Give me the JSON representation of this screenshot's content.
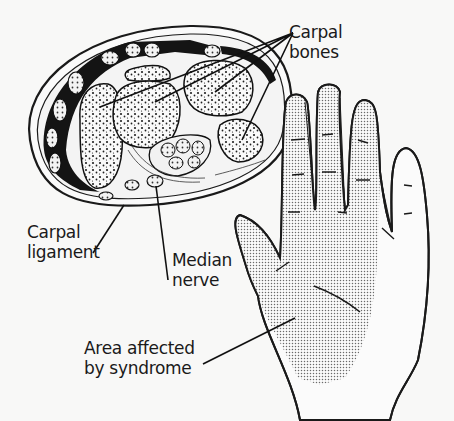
{
  "figure": {
    "colors": {
      "ink": "#1a1a1a",
      "background": "#f8f8f7",
      "stipple": "#6a6a6a"
    }
  },
  "labels": {
    "carpal_bones": [
      "Carpal",
      "bones"
    ],
    "carpal_ligament": [
      "Carpal",
      "ligament"
    ],
    "median_nerve": [
      "Median",
      "nerve"
    ],
    "area_affected": [
      "Area affected",
      "by syndrome"
    ]
  },
  "illustrations": {
    "cross_section": "wrist-cross-section",
    "hand": "palm-of-right-hand"
  }
}
